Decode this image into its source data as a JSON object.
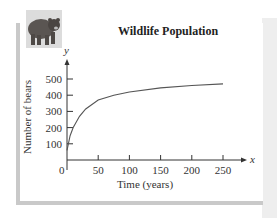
{
  "chart_data": {
    "type": "line",
    "title": "Wildlife Population",
    "xlabel": "Time (years)",
    "ylabel": "Number of bears",
    "x_axis_var": "x",
    "y_axis_var": "y",
    "xlim": [
      0,
      270
    ],
    "ylim": [
      0,
      560
    ],
    "x_ticks": [
      0,
      50,
      100,
      150,
      200,
      250
    ],
    "y_ticks": [
      100,
      200,
      300,
      400,
      500
    ],
    "grid": false,
    "legend": null,
    "series": [
      {
        "name": "Number of bears",
        "x": [
          0,
          5,
          10,
          20,
          30,
          50,
          75,
          100,
          150,
          200,
          250
        ],
        "values": [
          60,
          150,
          200,
          270,
          315,
          370,
          400,
          420,
          445,
          460,
          470
        ]
      }
    ]
  },
  "labels": {
    "title": "Wildlife Population",
    "xlabel": "Time (years)",
    "ylabel": "Number of bears",
    "x_var": "x",
    "y_var": "y",
    "origin": "0"
  },
  "image": {
    "icon": "bear-photo"
  }
}
